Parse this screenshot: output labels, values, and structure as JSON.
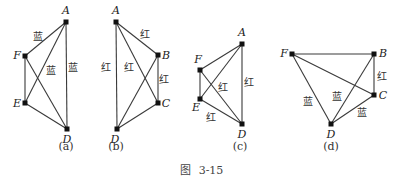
{
  "caption": {
    "prefix": "图",
    "number": "3-15"
  },
  "panels": [
    {
      "id": "a",
      "label": "(a)",
      "label_pos": [
        66,
        150
      ],
      "nodes": [
        {
          "name": "A",
          "x": 66,
          "y": 22,
          "lx": 66,
          "ly": 14,
          "anchor": "middle"
        },
        {
          "name": "F",
          "x": 25,
          "y": 56,
          "lx": 17,
          "ly": 59,
          "anchor": "middle"
        },
        {
          "name": "E",
          "x": 25,
          "y": 103,
          "lx": 17,
          "ly": 107,
          "anchor": "middle"
        },
        {
          "name": "D",
          "x": 67,
          "y": 129,
          "lx": 67,
          "ly": 143,
          "anchor": "middle"
        }
      ],
      "edges": [
        [
          "A",
          "F"
        ],
        [
          "A",
          "E"
        ],
        [
          "A",
          "D"
        ],
        [
          "F",
          "E"
        ],
        [
          "F",
          "D"
        ],
        [
          "E",
          "D"
        ]
      ],
      "edge_labels": [
        {
          "text": "蓝",
          "x": 38,
          "y": 40
        },
        {
          "text": "蓝",
          "x": 51,
          "y": 74
        },
        {
          "text": "蓝",
          "x": 73,
          "y": 71
        }
      ]
    },
    {
      "id": "b",
      "label": "(b)",
      "label_pos": [
        116,
        150
      ],
      "nodes": [
        {
          "name": "A",
          "x": 116,
          "y": 22,
          "lx": 116,
          "ly": 14,
          "anchor": "middle"
        },
        {
          "name": "B",
          "x": 158,
          "y": 55,
          "lx": 166,
          "ly": 59,
          "anchor": "middle"
        },
        {
          "name": "C",
          "x": 158,
          "y": 103,
          "lx": 166,
          "ly": 107,
          "anchor": "middle"
        },
        {
          "name": "D",
          "x": 117,
          "y": 129,
          "lx": 115,
          "ly": 143,
          "anchor": "middle"
        }
      ],
      "edges": [
        [
          "A",
          "B"
        ],
        [
          "A",
          "C"
        ],
        [
          "A",
          "D"
        ],
        [
          "B",
          "C"
        ],
        [
          "B",
          "D"
        ],
        [
          "C",
          "D"
        ]
      ],
      "edge_labels": [
        {
          "text": "红",
          "x": 145,
          "y": 38
        },
        {
          "text": "红",
          "x": 164,
          "y": 83
        },
        {
          "text": "红",
          "x": 106,
          "y": 71
        },
        {
          "text": "红",
          "x": 129,
          "y": 71
        }
      ]
    },
    {
      "id": "c",
      "label": "(c)",
      "label_pos": [
        240,
        150
      ],
      "nodes": [
        {
          "name": "A",
          "x": 242,
          "y": 44,
          "lx": 242,
          "ly": 36,
          "anchor": "middle"
        },
        {
          "name": "F",
          "x": 200,
          "y": 70,
          "lx": 198,
          "ly": 63,
          "anchor": "middle"
        },
        {
          "name": "E",
          "x": 200,
          "y": 99,
          "lx": 196,
          "ly": 111,
          "anchor": "middle"
        },
        {
          "name": "D",
          "x": 242,
          "y": 124,
          "lx": 242,
          "ly": 138,
          "anchor": "middle"
        }
      ],
      "edges": [
        [
          "A",
          "F"
        ],
        [
          "A",
          "E"
        ],
        [
          "A",
          "D"
        ],
        [
          "F",
          "E"
        ],
        [
          "F",
          "D"
        ],
        [
          "E",
          "D"
        ]
      ],
      "edge_labels": [
        {
          "text": "红",
          "x": 223,
          "y": 91
        },
        {
          "text": "红",
          "x": 249,
          "y": 86
        },
        {
          "text": "红",
          "x": 211,
          "y": 121
        }
      ]
    },
    {
      "id": "d",
      "label": "(d)",
      "label_pos": [
        331,
        150
      ],
      "nodes": [
        {
          "name": "F",
          "x": 292,
          "y": 54,
          "lx": 284,
          "ly": 57,
          "anchor": "middle"
        },
        {
          "name": "B",
          "x": 374,
          "y": 54,
          "lx": 383,
          "ly": 57,
          "anchor": "middle"
        },
        {
          "name": "C",
          "x": 374,
          "y": 95,
          "lx": 383,
          "ly": 99,
          "anchor": "middle"
        },
        {
          "name": "D",
          "x": 331,
          "y": 124,
          "lx": 331,
          "ly": 138,
          "anchor": "middle"
        }
      ],
      "edges": [
        [
          "F",
          "B"
        ],
        [
          "F",
          "C"
        ],
        [
          "F",
          "D"
        ],
        [
          "B",
          "C"
        ],
        [
          "B",
          "D"
        ],
        [
          "C",
          "D"
        ]
      ],
      "edge_labels": [
        {
          "text": "红",
          "x": 382,
          "y": 80
        },
        {
          "text": "蓝",
          "x": 308,
          "y": 105
        },
        {
          "text": "蓝",
          "x": 337,
          "y": 100
        },
        {
          "text": "蓝",
          "x": 362,
          "y": 116
        }
      ]
    }
  ]
}
